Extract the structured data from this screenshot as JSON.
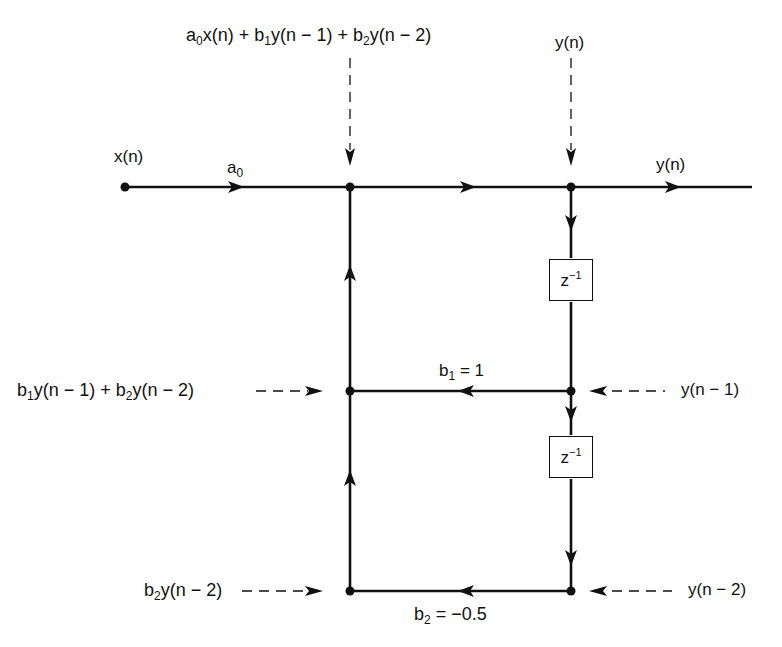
{
  "diagram": {
    "type": "signal-flow-graph",
    "colors": {
      "line": "#111111",
      "background": "#ffffff"
    },
    "labels": {
      "input": "x(n)",
      "gain_a0": {
        "base": "a",
        "sub": "0"
      },
      "top_sum_expr": {
        "p1": "a",
        "p1_sub": "0",
        "p1_rest": "x(n) + b",
        "p2_sub": "1",
        "p2_rest": "y(n − 1) + b",
        "p3_sub": "2",
        "p3_rest": "y(n − 2)"
      },
      "top_output_probe": "y(n)",
      "output": "y(n)",
      "feedback_sum_expr": {
        "p1": "b",
        "p1_sub": "1",
        "p1_rest": "y(n − 1) + b",
        "p2_sub": "2",
        "p2_rest": "y(n − 2)"
      },
      "delay1_output": "y(n − 1)",
      "coef_b1": {
        "base": "b",
        "sub": "1",
        "rest": " = 1"
      },
      "coef_b2": {
        "base": "b",
        "sub": "2",
        "rest": " = −0.5"
      },
      "feedback_b2_expr": {
        "base": "b",
        "sub": "2",
        "rest": "y(n − 2)"
      },
      "delay2_output": "y(n − 2)",
      "delay_block": {
        "base": "z",
        "sup": "−1"
      }
    },
    "nodes": [
      {
        "id": "x_in",
        "x": 125,
        "y": 187
      },
      {
        "id": "sum_top",
        "x": 350,
        "y": 187
      },
      {
        "id": "y_out",
        "x": 571,
        "y": 187
      },
      {
        "id": "sum_mid",
        "x": 350,
        "y": 391
      },
      {
        "id": "y_n1",
        "x": 571,
        "y": 391
      },
      {
        "id": "sum_bot",
        "x": 350,
        "y": 591
      },
      {
        "id": "y_n2",
        "x": 571,
        "y": 591
      }
    ],
    "branches": [
      {
        "from": "x_in",
        "to": "sum_top",
        "gain": "a0"
      },
      {
        "from": "sum_top",
        "to": "y_out",
        "gain": "1"
      },
      {
        "from": "y_out",
        "to": "output",
        "gain": "1"
      },
      {
        "from": "y_out",
        "to": "y_n1",
        "gain": "z^-1"
      },
      {
        "from": "y_n1",
        "to": "y_n2",
        "gain": "z^-1"
      },
      {
        "from": "y_n1",
        "to": "sum_mid",
        "gain": "b1 = 1"
      },
      {
        "from": "y_n2",
        "to": "sum_bot",
        "gain": "b2 = -0.5"
      },
      {
        "from": "sum_bot",
        "to": "sum_mid",
        "gain": "1"
      },
      {
        "from": "sum_mid",
        "to": "sum_top",
        "gain": "1"
      }
    ]
  }
}
